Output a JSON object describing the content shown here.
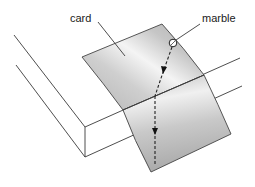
{
  "figure": {
    "labels": {
      "card": "card",
      "marble": "marble"
    },
    "colors": {
      "card_light": "#f2f2f2",
      "card_mid": "#c8c8c8",
      "card_dark": "#a8a8a8",
      "lines": "#3a3a3a",
      "background": "#ffffff"
    },
    "elements": [
      "table",
      "card folded over table edge",
      "marble",
      "dashed trajectory with arrows"
    ]
  }
}
